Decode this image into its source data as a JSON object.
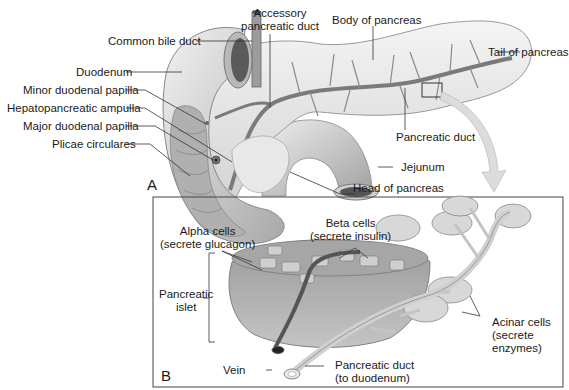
{
  "figure": {
    "panels": [
      {
        "id": "A",
        "letter": "A",
        "title": "Gross anatomy of pancreas and duodenum"
      },
      {
        "id": "B",
        "letter": "B",
        "title": "Histology of pancreatic islet and acini"
      }
    ]
  },
  "panel_a": {
    "letter": "A",
    "labels": {
      "accessory_duct_1": "Accessory",
      "accessory_duct_2": "pancreatic duct",
      "body": "Body of pancreas",
      "common_bile_duct": "Common bile duct",
      "tail": "Tail of pancreas",
      "duodenum": "Duodenum",
      "minor_papilla": "Minor duodenal papilla",
      "ampulla": "Hepatopancreatic ampulla",
      "major_papilla": "Major duodenal papilla",
      "plicae": "Plicae circulares",
      "pancreatic_duct": "Pancreatic duct",
      "jejunum": "Jejunum",
      "head": "Head of pancreas"
    }
  },
  "panel_b": {
    "letter": "B",
    "labels": {
      "alpha_1": "Alpha cells",
      "alpha_2": "(secrete glucagon)",
      "beta_1": "Beta cells",
      "beta_2": "(secrete insulin)",
      "islet_1": "Pancreatic",
      "islet_2": "islet",
      "acinar_1": "Acinar cells",
      "acinar_2": "(secrete",
      "acinar_3": "enzymes)",
      "vein": "Vein",
      "duct_1": "Pancreatic duct",
      "duct_2": "(to duodenum)"
    }
  },
  "colors": {
    "tissue_light": "#e6e6e6",
    "tissue_mid": "#c8c8c8",
    "tissue_dark": "#8c8c8c",
    "duct": "#7a7a7a",
    "line": "#333333",
    "arrow": "#d4d4d4"
  }
}
